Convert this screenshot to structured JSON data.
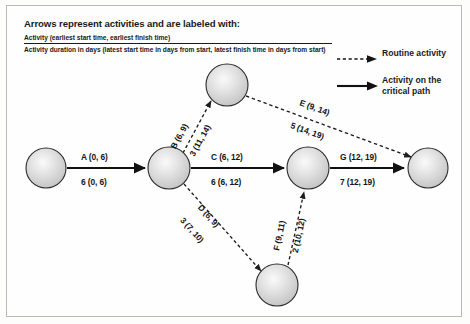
{
  "header": {
    "title": "Arrows represent activities and are labeled with:",
    "line1": "Activity (earliest start time, earliest finish time)",
    "line2": "Activity duration in days (latest start time in days from start, latest finish time in days from start)"
  },
  "legend": {
    "items": [
      {
        "label": "Routine activity",
        "style": "dashed",
        "icon": "dashed-arrow-icon"
      },
      {
        "label": "Activity on the\ncritical path",
        "style": "solid",
        "icon": "solid-arrow-icon"
      }
    ]
  },
  "diagram": {
    "type": "activity-on-arrow-network",
    "node_fill": "#d5d5d5",
    "node_stroke": "#2b2b2b",
    "critical_color": "#111111",
    "routine_color": "#333333",
    "nodes": [
      {
        "id": "n1",
        "cx": 46,
        "cy": 168,
        "r": 20
      },
      {
        "id": "n2",
        "cx": 169,
        "cy": 168,
        "r": 21
      },
      {
        "id": "n3",
        "cx": 227,
        "cy": 85,
        "r": 21
      },
      {
        "id": "n4",
        "cx": 308,
        "cy": 168,
        "r": 21
      },
      {
        "id": "n5",
        "cx": 277,
        "cy": 285,
        "r": 21
      },
      {
        "id": "n6",
        "cx": 428,
        "cy": 168,
        "r": 20
      }
    ],
    "edges": [
      {
        "id": "A",
        "from": "n1",
        "to": "n2",
        "critical": true,
        "top_label": "A (0, 6)",
        "bottom_label": "6 (0, 6)",
        "activity": "A",
        "earliest_start": 0,
        "earliest_finish": 6,
        "duration": 6,
        "latest_start": 0,
        "latest_finish": 6
      },
      {
        "id": "B",
        "from": "n2",
        "to": "n3",
        "critical": false,
        "top_label": "B (6, 9)",
        "bottom_label": "3 (11, 14)",
        "activity": "B",
        "earliest_start": 6,
        "earliest_finish": 9,
        "duration": 3,
        "latest_start": 11,
        "latest_finish": 14
      },
      {
        "id": "C",
        "from": "n2",
        "to": "n4",
        "critical": true,
        "top_label": "C (6, 12)",
        "bottom_label": "6 (6, 12)",
        "activity": "C",
        "earliest_start": 6,
        "earliest_finish": 12,
        "duration": 6,
        "latest_start": 6,
        "latest_finish": 12
      },
      {
        "id": "D",
        "from": "n2",
        "to": "n5",
        "critical": false,
        "top_label": "D (6, 9)",
        "bottom_label": "3 (7, 10)",
        "activity": "D",
        "earliest_start": 6,
        "earliest_finish": 9,
        "duration": 3,
        "latest_start": 7,
        "latest_finish": 10
      },
      {
        "id": "E",
        "from": "n3",
        "to": "n6",
        "critical": false,
        "top_label": "E (9, 14)",
        "bottom_label": "5 (14, 19)",
        "activity": "E",
        "earliest_start": 9,
        "earliest_finish": 14,
        "duration": 5,
        "latest_start": 14,
        "latest_finish": 19
      },
      {
        "id": "F",
        "from": "n5",
        "to": "n4",
        "critical": false,
        "top_label": "F (9, 11)",
        "bottom_label": "2 (10, 12)",
        "activity": "F",
        "earliest_start": 9,
        "earliest_finish": 11,
        "duration": 2,
        "latest_start": 10,
        "latest_finish": 12
      },
      {
        "id": "G",
        "from": "n4",
        "to": "n6",
        "critical": true,
        "top_label": "G (12, 19)",
        "bottom_label": "7 (12, 19)",
        "activity": "G",
        "earliest_start": 12,
        "earliest_finish": 19,
        "duration": 7,
        "latest_start": 12,
        "latest_finish": 19
      }
    ]
  }
}
